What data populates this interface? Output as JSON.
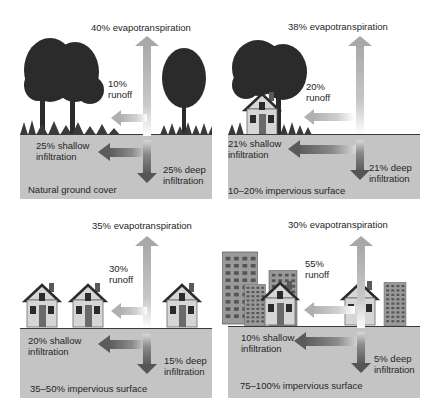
{
  "figure": {
    "type": "water-cycle-land-cover-comparison",
    "colors": {
      "ground": "#c4c4c4",
      "arrow_light": "#b8b8b8",
      "arrow_dark": "#555555",
      "foliage": "#2b2b2b",
      "building": "#8a8a8a",
      "house_wall": "#d6d6d6"
    },
    "panels": [
      {
        "id": "natural",
        "caption": "Natural ground cover",
        "evapotranspiration": "40% evapotranspiration",
        "runoff_pct": "10%",
        "runoff_label": "runoff",
        "shallow_pct": "25% shallow",
        "shallow_label": "infiltration",
        "deep_pct": "25% deep",
        "deep_label": "infiltration"
      },
      {
        "id": "low",
        "caption": "10–20% impervious surface",
        "evapotranspiration": "38% evapotranspiration",
        "runoff_pct": "20%",
        "runoff_label": "runoff",
        "shallow_pct": "21% shallow",
        "shallow_label": "infiltration",
        "deep_pct": "21% deep",
        "deep_label": "infiltration"
      },
      {
        "id": "medium",
        "caption": "35–50% impervious surface",
        "evapotranspiration": "35% evapotranspiration",
        "runoff_pct": "30%",
        "runoff_label": "runoff",
        "shallow_pct": "20% shallow",
        "shallow_label": "infiltration",
        "deep_pct": "15% deep",
        "deep_label": "infiltration"
      },
      {
        "id": "high",
        "caption": "75–100% impervious surface",
        "evapotranspiration": "30% evapotranspiration",
        "runoff_pct": "55%",
        "runoff_label": "runoff",
        "shallow_pct": "10% shallow",
        "shallow_label": "infiltration",
        "deep_pct": "5% deep",
        "deep_label": "infiltration"
      }
    ]
  }
}
